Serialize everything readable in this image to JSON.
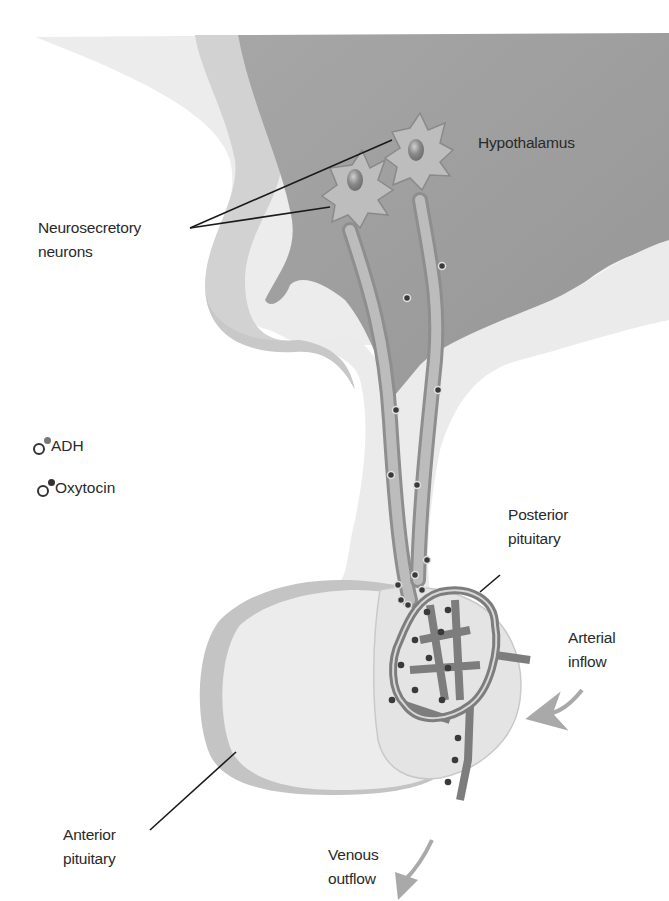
{
  "figure": {
    "colors": {
      "background": "#ffffff",
      "hypothalamus_fill": "#9e9e9e",
      "tissue_light": "#e8e8e8",
      "tissue_rim": "#bdbdbd",
      "neuron_fill": "#b3b3b3",
      "capillary": "#7d7d7d",
      "granule": "#3a3a3a",
      "adh_dot": "#777777",
      "oxytocin_dot": "#333333",
      "arrow": "#a9a9a9",
      "leader_line": "#1a1a1a"
    }
  },
  "labels": {
    "hypothalamus": "Hypothalamus",
    "neurosecretory_neurons": [
      "Neurosecretory",
      "neurons"
    ],
    "posterior_pituitary": [
      "Posterior",
      "pituitary"
    ],
    "arterial_inflow": [
      "Arterial",
      "inflow"
    ],
    "anterior_pituitary": [
      "Anterior",
      "pituitary"
    ],
    "venous_outflow": [
      "Venous",
      "outflow"
    ]
  },
  "legend": {
    "items": [
      {
        "label": "ADH",
        "dot_color": "#777777"
      },
      {
        "label": "Oxytocin",
        "dot_color": "#333333"
      }
    ]
  }
}
